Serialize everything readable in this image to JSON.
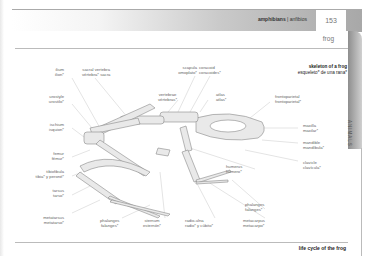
{
  "header": {
    "section_en": "amphibians",
    "separator": " | ",
    "section_es": "anfibios",
    "page_number": "153",
    "subject": "frog",
    "side_tab": "ANIMALS"
  },
  "figure": {
    "title_en": "skeleton of a frog",
    "title_es": "esqueleto* de una rana*",
    "labels": [
      {
        "id": "ilium",
        "en": "ilium",
        "es": "ilion*"
      },
      {
        "id": "sacral-vertebra",
        "en": "sacral vertebra",
        "es": "vértebra* sacra"
      },
      {
        "id": "scapula",
        "en": "scapula",
        "es": "omoplato*"
      },
      {
        "id": "coracoid",
        "en": "coracoid",
        "es": "coracoides*"
      },
      {
        "id": "urostyle",
        "en": "urostyle",
        "es": "urostilo*"
      },
      {
        "id": "vertebrae",
        "en": "vertebrae",
        "es": "vértebras*"
      },
      {
        "id": "atlas",
        "en": "atlas",
        "es": "atlas*"
      },
      {
        "id": "frontoparietal",
        "en": "frontoparietal",
        "es": "frontoparietal*"
      },
      {
        "id": "ischium",
        "en": "ischium",
        "es": "isquion*"
      },
      {
        "id": "maxilla",
        "en": "maxilla",
        "es": "maxilar*"
      },
      {
        "id": "mandible",
        "en": "mandible",
        "es": "mandíbula*"
      },
      {
        "id": "femur",
        "en": "femur",
        "es": "fémur*"
      },
      {
        "id": "clavicle",
        "en": "clavicle",
        "es": "clavícula*"
      },
      {
        "id": "humerus",
        "en": "humerus",
        "es": "húmero*"
      },
      {
        "id": "tibiofibula",
        "en": "tibiofibula",
        "es": "tibia* y peroné*"
      },
      {
        "id": "tarsus",
        "en": "tarsus",
        "es": "tarso*"
      },
      {
        "id": "phalanges-fore",
        "en": "phalanges",
        "es": "falanges*"
      },
      {
        "id": "metatarsus",
        "en": "metatarsus",
        "es": "metatarso*"
      },
      {
        "id": "phalanges-hind",
        "en": "phalanges",
        "es": "falanges*"
      },
      {
        "id": "sternum",
        "en": "sternum",
        "es": "esternón*"
      },
      {
        "id": "radio-ulna",
        "en": "radio-ulna",
        "es": "radio* y cúbito*"
      },
      {
        "id": "metacarpus",
        "en": "metacarpus",
        "es": "metacarpo*"
      }
    ]
  },
  "footer": {
    "next_heading": "life cycle of the frog"
  }
}
